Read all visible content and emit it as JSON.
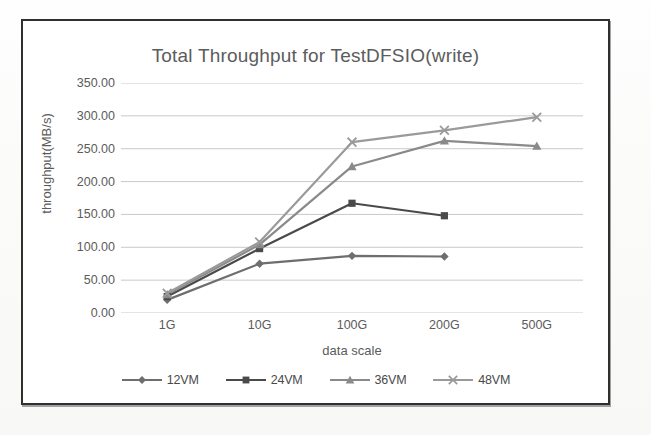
{
  "chart_data": {
    "type": "line",
    "title": "Total Throughput for TestDFSIO(write)",
    "xlabel": "data scale",
    "ylabel": "throughput(MB/s)",
    "categories": [
      "1G",
      "10G",
      "100G",
      "200G",
      "500G"
    ],
    "ylim": [
      0,
      350
    ],
    "ytick_step": 50,
    "ytick_labels": [
      "0.00",
      "50.00",
      "100.00",
      "150.00",
      "200.00",
      "250.00",
      "300.00",
      "350.00"
    ],
    "grid": "horizontal",
    "legend_position": "bottom",
    "series": [
      {
        "name": "12VM",
        "marker": "diamond",
        "color": "#6e6e6e",
        "values": [
          20,
          75,
          87,
          86,
          null
        ]
      },
      {
        "name": "24VM",
        "marker": "square",
        "color": "#4a4a4a",
        "values": [
          25,
          98,
          167,
          148,
          null
        ]
      },
      {
        "name": "36VM",
        "marker": "triangle",
        "color": "#8a8a8a",
        "values": [
          28,
          104,
          223,
          262,
          254
        ]
      },
      {
        "name": "48VM",
        "marker": "cross",
        "color": "#9a9a9a",
        "values": [
          30,
          108,
          260,
          278,
          298
        ]
      }
    ]
  },
  "colors": {
    "frame": "#2f2f2f",
    "text": "#5b5b5b",
    "gridline": "#c9c9c9",
    "plot_background": "#ffffff"
  }
}
